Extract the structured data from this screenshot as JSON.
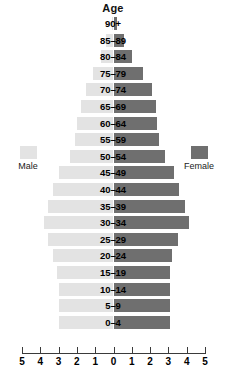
{
  "chart_data": {
    "type": "bar",
    "title": "Age",
    "subtitle": "",
    "xlabel": "",
    "ylabel": "Age",
    "orientation": "horizontal-diverging",
    "categories": [
      "90+",
      "85–89",
      "80–84",
      "75–79",
      "70–74",
      "65–69",
      "60–64",
      "55–59",
      "50–54",
      "45–49",
      "40–44",
      "35–39",
      "30–34",
      "25–29",
      "20–24",
      "15–19",
      "10–14",
      "5–9",
      "0–4"
    ],
    "series": [
      {
        "name": "Male",
        "side": "left",
        "color": "#e3e3e3",
        "values": [
          0.1,
          0.4,
          0.7,
          1.1,
          1.5,
          1.8,
          2.0,
          2.1,
          2.4,
          3.0,
          3.3,
          3.6,
          3.8,
          3.6,
          3.3,
          3.1,
          3.0,
          3.0,
          3.0
        ]
      },
      {
        "name": "Female",
        "side": "right",
        "color": "#6f6f6f",
        "values": [
          0.2,
          0.6,
          1.0,
          1.6,
          2.1,
          2.3,
          2.4,
          2.5,
          2.8,
          3.3,
          3.6,
          3.9,
          4.1,
          3.5,
          3.2,
          3.1,
          3.1,
          3.1,
          3.1
        ]
      }
    ],
    "xticks": [
      5,
      4,
      3,
      2,
      1,
      0,
      1,
      2,
      3,
      4,
      5
    ],
    "xlim": [
      -5,
      5
    ],
    "grid": false,
    "legend_position": "sides"
  },
  "legend": {
    "male_label": "Male",
    "female_label": "Female"
  },
  "axis": {
    "tick_labels": [
      "5",
      "4",
      "3",
      "2",
      "1",
      "0",
      "1",
      "2",
      "3",
      "4",
      "5"
    ]
  }
}
